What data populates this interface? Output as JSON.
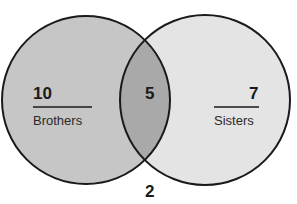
{
  "diagram": {
    "type": "venn",
    "sets": [
      {
        "name": "Brothers",
        "only_count": "10",
        "fill": "#c6c6c6"
      },
      {
        "name": "Sisters",
        "only_count": "7",
        "fill": "#e4e4e4"
      }
    ],
    "intersection": {
      "count": "5",
      "fill": "#a9a9a9"
    },
    "outside": {
      "count": "2"
    },
    "stroke": "#1a1a1a"
  }
}
